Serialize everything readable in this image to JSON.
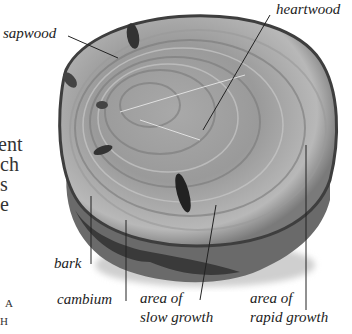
{
  "diagram": {
    "labels": {
      "sapwood": "sapwood",
      "heartwood": "heartwood",
      "bark": "bark",
      "cambium": "cambium",
      "slow_growth_line1": "area of",
      "slow_growth_line2": "slow growth",
      "rapid_growth_line1": "area of",
      "rapid_growth_line2": "rapid growth"
    },
    "cropped_body_text": [
      "ent",
      "ch",
      "s",
      "e"
    ],
    "cropped_caption": [
      "A",
      "H"
    ],
    "colors": {
      "background": "#ffffff",
      "wood_light": "#b5b5b5",
      "wood_mid": "#8f8f8f",
      "wood_dark": "#5a5a5a",
      "bark": "#3a3a3a",
      "leader_line": "#222222"
    }
  }
}
